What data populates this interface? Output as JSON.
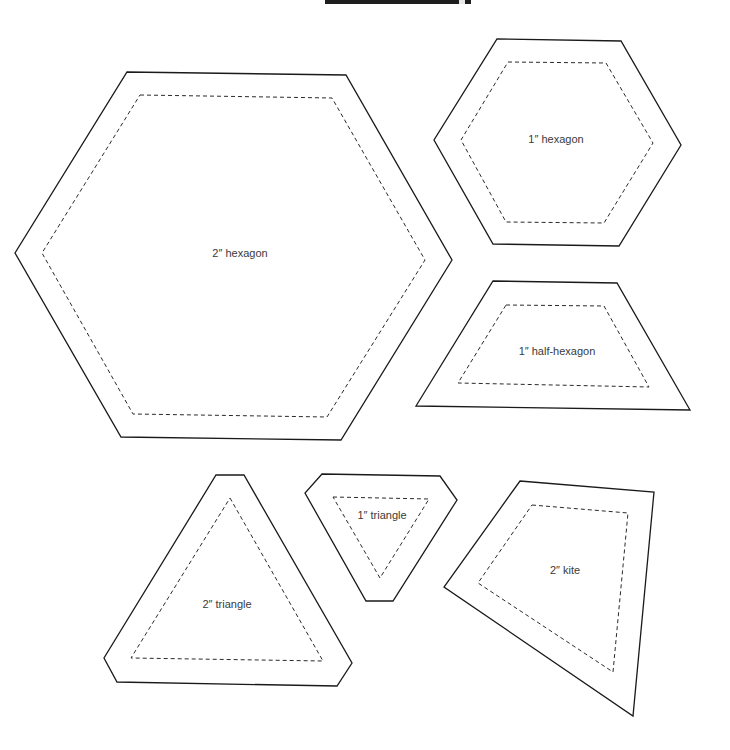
{
  "page": {
    "width": 730,
    "height": 750,
    "background": "#ffffff"
  },
  "templates": [
    {
      "id": "hex2",
      "label": "2″ hexagon",
      "label_pos": [
        240,
        253
      ],
      "cut_line": [
        [
          127,
          72
        ],
        [
          346,
          75
        ],
        [
          452,
          260
        ],
        [
          341,
          440
        ],
        [
          121,
          437
        ],
        [
          15,
          253
        ]
      ],
      "sew_line": [
        [
          140,
          95
        ],
        [
          332,
          98
        ],
        [
          425,
          260
        ],
        [
          327,
          417
        ],
        [
          133,
          414
        ],
        [
          42,
          253
        ]
      ]
    },
    {
      "id": "hex1",
      "label": "1″ hexagon",
      "label_pos": [
        556,
        139
      ],
      "cut_line": [
        [
          497,
          39
        ],
        [
          621,
          41
        ],
        [
          681,
          145
        ],
        [
          619,
          246
        ],
        [
          493,
          244
        ],
        [
          434,
          140
        ]
      ],
      "sew_line": [
        [
          508,
          62
        ],
        [
          606,
          63
        ],
        [
          653,
          143
        ],
        [
          604,
          223
        ],
        [
          506,
          222
        ],
        [
          461,
          140
        ]
      ]
    },
    {
      "id": "halfhex1",
      "label": "1″ half-hexagon",
      "label_pos": [
        557,
        351
      ],
      "cut_line": [
        [
          493,
          281
        ],
        [
          617,
          283
        ],
        [
          690,
          410
        ],
        [
          416,
          406
        ]
      ],
      "sew_line": [
        [
          506,
          305
        ],
        [
          604,
          306
        ],
        [
          649,
          387
        ],
        [
          458,
          383
        ]
      ]
    },
    {
      "id": "tri2",
      "label": "2″ triangle",
      "label_pos": [
        227,
        604
      ],
      "cut_line": [
        [
          216,
          475
        ],
        [
          244,
          475
        ],
        [
          352,
          663
        ],
        [
          337,
          686
        ],
        [
          117,
          682
        ],
        [
          104,
          658
        ]
      ],
      "sew_line": [
        [
          230,
          498
        ],
        [
          323,
          661
        ],
        [
          131,
          658
        ]
      ]
    },
    {
      "id": "tri1",
      "label": "1″ triangle",
      "label_pos": [
        382,
        515
      ],
      "cut_line": [
        [
          322,
          474
        ],
        [
          440,
          476
        ],
        [
          457,
          500
        ],
        [
          393,
          601
        ],
        [
          366,
          601
        ],
        [
          305,
          493
        ]
      ],
      "sew_line": [
        [
          333,
          497
        ],
        [
          429,
          499
        ],
        [
          380,
          578
        ]
      ]
    },
    {
      "id": "kite2",
      "label": "2″ kite",
      "label_pos": [
        565,
        570
      ],
      "cut_line": [
        [
          520,
          481
        ],
        [
          654,
          492
        ],
        [
          633,
          716
        ],
        [
          444,
          587
        ]
      ],
      "sew_line": [
        [
          532,
          505
        ],
        [
          628,
          513
        ],
        [
          613,
          672
        ],
        [
          478,
          583
        ]
      ]
    }
  ]
}
